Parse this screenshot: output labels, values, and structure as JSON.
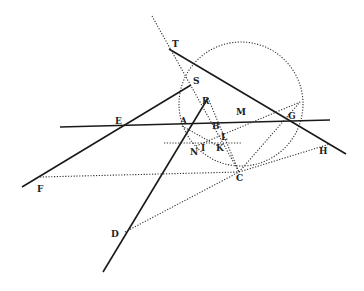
{
  "diagram": {
    "type": "geometric-construction",
    "points": [
      {
        "name": "T",
        "x": 169,
        "y": 49,
        "lx": 172,
        "ly": 47
      },
      {
        "name": "S",
        "x": 191,
        "y": 85,
        "lx": 192,
        "ly": 84
      },
      {
        "name": "R",
        "x": 208,
        "y": 98,
        "lx": 202,
        "ly": 103
      },
      {
        "name": "M",
        "x": 258,
        "y": 111,
        "lx": 236,
        "ly": 115
      },
      {
        "name": "G",
        "x": 293,
        "y": 121,
        "lx": 288,
        "ly": 118
      },
      {
        "name": "E",
        "x": 121,
        "y": 125,
        "lx": 115,
        "ly": 123
      },
      {
        "name": "A",
        "x": 190,
        "y": 125,
        "lx": 180,
        "ly": 124
      },
      {
        "name": "B",
        "x": 213,
        "y": 124,
        "lx": 212,
        "ly": 129
      },
      {
        "name": "L",
        "x": 226,
        "y": 138,
        "lx": 221,
        "ly": 139
      },
      {
        "name": "N",
        "x": 196,
        "y": 146,
        "lx": 190,
        "ly": 154
      },
      {
        "name": "I",
        "x": 200,
        "y": 146,
        "lx": 201,
        "ly": 151
      },
      {
        "name": "K",
        "x": 218,
        "y": 146,
        "lx": 216,
        "ly": 150
      },
      {
        "name": "H",
        "x": 330,
        "y": 144,
        "lx": 319,
        "ly": 153
      },
      {
        "name": "C",
        "x": 239,
        "y": 172,
        "lx": 236,
        "ly": 180
      },
      {
        "name": "F",
        "x": 22,
        "y": 187,
        "lx": 37,
        "ly": 191
      },
      {
        "name": "D",
        "x": 123,
        "y": 233,
        "lx": 111,
        "ly": 236
      }
    ],
    "solid_lines": [
      {
        "from": [
          60,
          127
        ],
        "to": [
          330,
          120
        ],
        "desc": "line E-A-B-G"
      },
      {
        "from": [
          169,
          49
        ],
        "to": [
          346,
          154
        ],
        "desc": "line T-G-H"
      },
      {
        "from": [
          22,
          187
        ],
        "to": [
          191,
          85
        ],
        "desc": "line F-E-S"
      },
      {
        "from": [
          103,
          272
        ],
        "to": [
          208,
          98
        ],
        "desc": "line D-A-R"
      }
    ],
    "dotted_lines": [
      {
        "from": [
          152,
          16
        ],
        "to": [
          239,
          172
        ],
        "desc": "line through T, S, N, C"
      },
      {
        "from": [
          40,
          177
        ],
        "to": [
          239,
          172
        ],
        "desc": "F to C"
      },
      {
        "from": [
          239,
          172
        ],
        "to": [
          330,
          144
        ],
        "desc": "C to H"
      },
      {
        "from": [
          125,
          232
        ],
        "to": [
          239,
          172
        ],
        "desc": "D to C"
      },
      {
        "from": [
          239,
          172
        ],
        "to": [
          300,
          102
        ],
        "desc": "C toward M"
      },
      {
        "from": [
          164,
          143
        ],
        "to": [
          242,
          143
        ],
        "desc": "horizontal through N, I, K"
      },
      {
        "from": [
          208,
          98
        ],
        "to": [
          239,
          172
        ],
        "desc": "R to C"
      },
      {
        "from": [
          196,
          146
        ],
        "to": [
          300,
          102
        ],
        "desc": "N to M"
      },
      {
        "from": [
          182,
          126
        ],
        "to": [
          218,
          146
        ],
        "desc": "A to K"
      }
    ],
    "circle": {
      "cx": 241,
      "cy": 104,
      "r": 62,
      "style": "dotted"
    }
  }
}
